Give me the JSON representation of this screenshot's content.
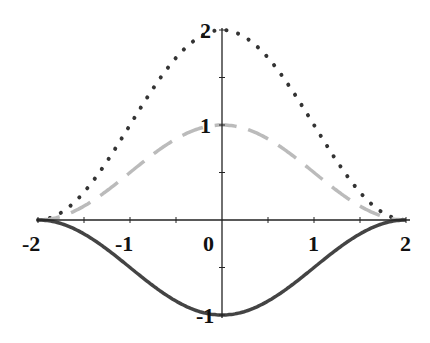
{
  "chart_data": {
    "type": "line",
    "title": "",
    "xlabel": "",
    "ylabel": "",
    "xlim": [
      -2,
      2
    ],
    "ylim": [
      -1,
      2
    ],
    "grid": false,
    "legend": null,
    "x_ticks": [
      "-2",
      "-1",
      "0",
      "1",
      "2"
    ],
    "y_ticks": [
      "2",
      "1",
      "-1"
    ],
    "x": [
      -2,
      -1.5,
      -1,
      -0.5,
      0,
      0.5,
      1,
      1.5,
      2
    ],
    "series": [
      {
        "name": "dotted",
        "style": "dotted",
        "color": "#333333",
        "values": [
          0,
          0.29,
          1.0,
          1.71,
          2.0,
          1.71,
          1.0,
          0.29,
          0
        ]
      },
      {
        "name": "dashed",
        "style": "dashed",
        "color": "#bbbbbb",
        "values": [
          0,
          0.15,
          0.5,
          0.85,
          1.0,
          0.85,
          0.5,
          0.15,
          0
        ]
      },
      {
        "name": "solid",
        "style": "solid",
        "color": "#444444",
        "values": [
          0,
          -0.15,
          -0.5,
          -0.85,
          -1.0,
          -0.85,
          -0.5,
          -0.15,
          0
        ]
      }
    ]
  },
  "labels": {
    "xm2": "-2",
    "xm1": "-1",
    "x0": "0",
    "x1": "1",
    "x2": "2",
    "y2": "2",
    "y1": "1",
    "ym1": "-1"
  }
}
